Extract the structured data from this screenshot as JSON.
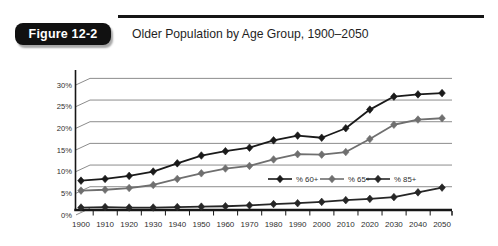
{
  "figure": {
    "badge_label": "Figure 12-2",
    "title": "Older Population by Age Group, 1900–2050"
  },
  "chart_data": {
    "type": "line",
    "title": "Older Population by Age Group, 1900–2050",
    "categories": [
      "1900",
      "1910",
      "1920",
      "1930",
      "1940",
      "1950",
      "1960",
      "1970",
      "1980",
      "1990",
      "2000",
      "2010",
      "2020",
      "2030",
      "2040",
      "2050"
    ],
    "series": [
      {
        "name": "% 60+",
        "color": "#1a1a1a",
        "values": [
          6.4,
          6.8,
          7.5,
          8.5,
          10.4,
          12.2,
          13.2,
          14.0,
          15.7,
          16.8,
          16.3,
          18.5,
          22.8,
          25.8,
          26.3,
          26.6
        ]
      },
      {
        "name": "% 65+",
        "color": "#6f6f6f",
        "values": [
          4.1,
          4.3,
          4.7,
          5.4,
          6.8,
          8.1,
          9.2,
          9.8,
          11.3,
          12.5,
          12.4,
          13.0,
          16.0,
          19.3,
          20.5,
          20.8
        ]
      },
      {
        "name": "% 85+",
        "color": "#262626",
        "values": [
          0.2,
          0.3,
          0.2,
          0.2,
          0.3,
          0.4,
          0.5,
          0.7,
          1.0,
          1.2,
          1.5,
          1.9,
          2.2,
          2.6,
          3.7,
          4.8
        ]
      }
    ],
    "xlabel": "",
    "ylabel": "",
    "ylabel_ticks": [
      "0%",
      "5%",
      "10%",
      "15%",
      "20%",
      "25%",
      "30%"
    ],
    "ylim": [
      0,
      30
    ],
    "y_step": 5,
    "grid": true,
    "legend_position": "inside-middle-right",
    "marker": "diamond",
    "grid_color": "#8c8c8c",
    "axis_color": "#161616",
    "tick_label_color": "#2e2e2e"
  }
}
